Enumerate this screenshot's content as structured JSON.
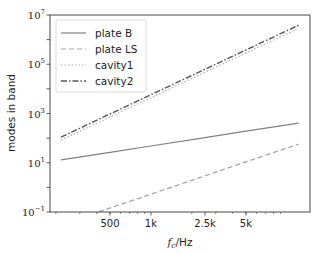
{
  "chart_data": {
    "type": "line",
    "title": "",
    "xlabel": "f_c/Hz",
    "xlabel_parts": {
      "main": "f",
      "sub": "c",
      "unit": "/Hz"
    },
    "ylabel": "modes in band",
    "xscale": "log",
    "yscale": "log",
    "xlim": [
      181,
      14800
    ],
    "ylim": [
      0.1,
      10000000
    ],
    "grid": false,
    "legend_position": "top-left",
    "x_ticks": [
      {
        "value": 500,
        "label": "500"
      },
      {
        "value": 1000,
        "label": "1k"
      },
      {
        "value": 2500,
        "label": "2.5k"
      },
      {
        "value": 5000,
        "label": "5k"
      }
    ],
    "y_ticks": [
      {
        "value": 0.1,
        "base": "10",
        "exp": "−1"
      },
      {
        "value": 10,
        "base": "10",
        "exp": "1"
      },
      {
        "value": 1000,
        "base": "10",
        "exp": "3"
      },
      {
        "value": 100000,
        "base": "10",
        "exp": "5"
      },
      {
        "value": 10000000,
        "base": "10",
        "exp": "7"
      }
    ],
    "x": [
      218,
      500,
      1000,
      2500,
      5000,
      12200
    ],
    "series": [
      {
        "name": "plate B",
        "style": "solid",
        "color": "#808080",
        "values": [
          13,
          26.5,
          48,
          105,
          191,
          409
        ]
      },
      {
        "name": "plate LS",
        "style": "dashed",
        "color": "#a0a0a0",
        "values": [
          0.031,
          0.146,
          0.53,
          2.95,
          10.8,
          57
        ]
      },
      {
        "name": "cavity1",
        "style": "dotted",
        "color": "#b0b0b0",
        "values": [
          83,
          719,
          4360,
          47200,
          286000,
          2910000
        ]
      },
      {
        "name": "cavity2",
        "style": "dashdot",
        "color": "#555555",
        "values": [
          110,
          953,
          5775,
          62500,
          380000,
          3860000
        ]
      }
    ]
  }
}
